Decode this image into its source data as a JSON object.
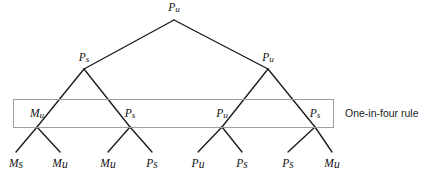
{
  "figure": {
    "title": "",
    "background_color": "#ffffff",
    "line_color": "#1a1a1a",
    "box_border_color": "#a0a0a0",
    "text_color": "#111111"
  },
  "annotation": {
    "label": "One-in-four rule",
    "x": 345,
    "y": 117
  },
  "group_box": {
    "name": "one-in-four-rule-box",
    "x": 13,
    "y": 99,
    "width": 320,
    "height": 28
  },
  "chart_data": {
    "type": "diagram",
    "subtype": "binary-tree",
    "levels": 4,
    "nodes": [
      {
        "id": "n0",
        "label_main": "P",
        "label_sub": "u",
        "label": "Pu",
        "level": 0,
        "x": 174,
        "y": 11,
        "apex_y": 20
      },
      {
        "id": "n1",
        "label_main": "P",
        "label_sub": "s",
        "label": "Ps",
        "level": 1,
        "x": 84,
        "y": 61,
        "apex_y": 69
      },
      {
        "id": "n2",
        "label_main": "P",
        "label_sub": "u",
        "label": "Pu",
        "level": 1,
        "x": 268,
        "y": 61,
        "apex_y": 69
      },
      {
        "id": "n3",
        "label_main": "M",
        "label_sub": "u",
        "label": "Mu",
        "level": 2,
        "x": 37,
        "y": 117,
        "apex_y": 127
      },
      {
        "id": "n4",
        "label_main": "P",
        "label_sub": "s",
        "label": "Ps",
        "level": 2,
        "x": 130,
        "y": 117,
        "apex_y": 127
      },
      {
        "id": "n5",
        "label_main": "P",
        "label_sub": "u",
        "label": "Pu",
        "level": 2,
        "x": 222,
        "y": 117,
        "apex_y": 127
      },
      {
        "id": "n6",
        "label_main": "P",
        "label_sub": "s",
        "label": "Ps",
        "level": 2,
        "x": 315,
        "y": 117,
        "apex_y": 127
      },
      {
        "id": "l0",
        "label_main": "M",
        "label_sub": "s",
        "label": "Ms",
        "level": 3,
        "x": 16,
        "y": 167,
        "apex_y": 152
      },
      {
        "id": "l1",
        "label_main": "M",
        "label_sub": "u",
        "label": "Mu",
        "level": 3,
        "x": 60,
        "y": 167,
        "apex_y": 152
      },
      {
        "id": "l2",
        "label_main": "M",
        "label_sub": "u",
        "label": "Mu",
        "level": 3,
        "x": 108,
        "y": 167,
        "apex_y": 152
      },
      {
        "id": "l3",
        "label_main": "P",
        "label_sub": "s",
        "label": "Ps",
        "level": 3,
        "x": 152,
        "y": 167,
        "apex_y": 152
      },
      {
        "id": "l4",
        "label_main": "P",
        "label_sub": "u",
        "label": "Pu",
        "level": 3,
        "x": 198,
        "y": 167,
        "apex_y": 152
      },
      {
        "id": "l5",
        "label_main": "P",
        "label_sub": "s",
        "label": "Ps",
        "level": 3,
        "x": 242,
        "y": 167,
        "apex_y": 152
      },
      {
        "id": "l6",
        "label_main": "P",
        "label_sub": "s",
        "label": "Ps",
        "level": 3,
        "x": 288,
        "y": 167,
        "apex_y": 152
      },
      {
        "id": "l7",
        "label_main": "M",
        "label_sub": "u",
        "label": "Mu",
        "level": 3,
        "x": 332,
        "y": 167,
        "apex_y": 152
      }
    ],
    "edges": [
      {
        "from": "n0",
        "to": "n1"
      },
      {
        "from": "n0",
        "to": "n2"
      },
      {
        "from": "n1",
        "to": "n3"
      },
      {
        "from": "n1",
        "to": "n4"
      },
      {
        "from": "n2",
        "to": "n5"
      },
      {
        "from": "n2",
        "to": "n6"
      },
      {
        "from": "n3",
        "to": "l0"
      },
      {
        "from": "n3",
        "to": "l1"
      },
      {
        "from": "n4",
        "to": "l2"
      },
      {
        "from": "n4",
        "to": "l3"
      },
      {
        "from": "n5",
        "to": "l4"
      },
      {
        "from": "n5",
        "to": "l5"
      },
      {
        "from": "n6",
        "to": "l6"
      },
      {
        "from": "n6",
        "to": "l7"
      }
    ]
  }
}
